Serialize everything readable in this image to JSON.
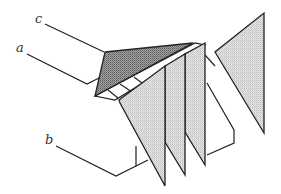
{
  "diagram": {
    "type": "line-drawing",
    "labels": {
      "a": "a",
      "b": "b",
      "c": "c"
    },
    "colors": {
      "line": "#222222",
      "light_fill": "#d9d9d9",
      "dark_fill": "#8a8a8a",
      "background": "#ffffff"
    }
  }
}
